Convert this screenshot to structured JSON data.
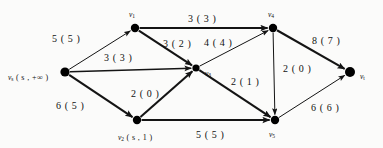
{
  "figure": {
    "type": "flow-network-diagram"
  },
  "nodes": [
    {
      "id": "vs",
      "name": "v_s",
      "base": "v",
      "sub": "s",
      "annotation": "( s ,  +∞ )",
      "x": 65,
      "y": 72,
      "r": 4.6,
      "label_x": 8,
      "label_y": 74
    },
    {
      "id": "v1",
      "name": "v_1",
      "base": "v",
      "sub": "1",
      "annotation": "",
      "x": 135,
      "y": 28,
      "r": 4.2,
      "label_x": 129,
      "label_y": 11
    },
    {
      "id": "v2",
      "name": "v_2",
      "base": "v",
      "sub": "2",
      "annotation": "( s ,  1 )",
      "x": 137,
      "y": 120,
      "r": 4.2,
      "label_x": 118,
      "label_y": 134
    },
    {
      "id": "v3",
      "name": "v_3",
      "base": "v",
      "sub": "3",
      "annotation": "",
      "x": 196,
      "y": 68,
      "r": 3.6,
      "label_x": 205,
      "label_y": 70
    },
    {
      "id": "v4",
      "name": "v_4",
      "base": "v",
      "sub": "4",
      "annotation": "",
      "x": 273,
      "y": 28,
      "r": 4.2,
      "label_x": 268,
      "label_y": 11
    },
    {
      "id": "v5",
      "name": "v_5",
      "base": "v",
      "sub": "5",
      "annotation": "",
      "x": 275,
      "y": 120,
      "r": 4.2,
      "label_x": 269,
      "label_y": 131
    },
    {
      "id": "vt",
      "name": "v_t",
      "base": "v",
      "sub": "t",
      "annotation": "",
      "x": 350,
      "y": 72,
      "r": 5.0,
      "label_x": 360,
      "label_y": 73
    }
  ],
  "edges": [
    {
      "id": "e-vs-v1",
      "from": "vs",
      "to": "v1",
      "capacity": 5,
      "flow": 5,
      "label": "5 ( 5 )",
      "label_x": 52,
      "label_y": 34,
      "weight": "thin"
    },
    {
      "id": "e-vs-v3",
      "from": "vs",
      "to": "v3",
      "capacity": 3,
      "flow": 3,
      "label": "3 ( 3 )",
      "label_x": 104,
      "label_y": 53,
      "weight": "med"
    },
    {
      "id": "e-vs-v2",
      "from": "vs",
      "to": "v2",
      "capacity": 6,
      "flow": 5,
      "label": "6 ( 5 )",
      "label_x": 56,
      "label_y": 101,
      "weight": "thick"
    },
    {
      "id": "e-v1-v4",
      "from": "v1",
      "to": "v4",
      "capacity": 3,
      "flow": 3,
      "label": "3 ( 3 )",
      "label_x": 188,
      "label_y": 14,
      "weight": "thick"
    },
    {
      "id": "e-v1-v3",
      "from": "v1",
      "to": "v3",
      "capacity": 3,
      "flow": 2,
      "label": "3 ( 2 )",
      "label_x": 163,
      "label_y": 39,
      "weight": "thick"
    },
    {
      "id": "e-v2-v3",
      "from": "v2",
      "to": "v3",
      "capacity": 2,
      "flow": 0,
      "label": "2 ( 0 )",
      "label_x": 131,
      "label_y": 89,
      "weight": "thick"
    },
    {
      "id": "e-v2-v5",
      "from": "v2",
      "to": "v5",
      "capacity": 5,
      "flow": 5,
      "label": "5 ( 5 )",
      "label_x": 196,
      "label_y": 130,
      "weight": "thick"
    },
    {
      "id": "e-v3-v4",
      "from": "v3",
      "to": "v4",
      "capacity": 4,
      "flow": 4,
      "label": "4 ( 4 )",
      "label_x": 204,
      "label_y": 38,
      "weight": "thin"
    },
    {
      "id": "e-v3-v5",
      "from": "v3",
      "to": "v5",
      "capacity": 2,
      "flow": 1,
      "label": "2 ( 1 )",
      "label_x": 231,
      "label_y": 77,
      "weight": "thick"
    },
    {
      "id": "e-v4-v5",
      "from": "v4",
      "to": "v5",
      "capacity": 2,
      "flow": 0,
      "label": "2 ( 0 )",
      "label_x": 283,
      "label_y": 64,
      "weight": "thin"
    },
    {
      "id": "e-v4-vt",
      "from": "v4",
      "to": "vt",
      "capacity": 8,
      "flow": 7,
      "label": "8 ( 7 )",
      "label_x": 312,
      "label_y": 36,
      "weight": "thick"
    },
    {
      "id": "e-v5-vt",
      "from": "v5",
      "to": "vt",
      "capacity": 6,
      "flow": 6,
      "label": "6 ( 6 )",
      "label_x": 311,
      "label_y": 103,
      "weight": "thin"
    }
  ],
  "colors": {
    "stroke": "#141414",
    "node": "#000000",
    "text": "#111111",
    "background": "#fbfbfa"
  }
}
